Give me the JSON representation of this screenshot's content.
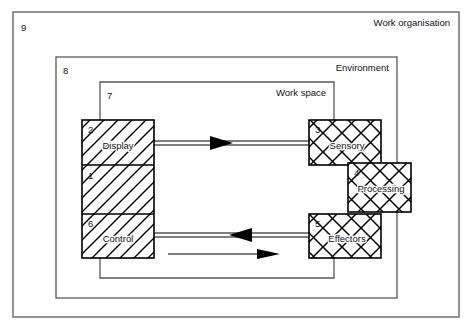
{
  "diagram": {
    "type": "block-diagram",
    "background_color": "#ffffff",
    "line_color": "#000000",
    "frame_color": "#555555",
    "frames": [
      {
        "id": "9",
        "number": "9",
        "label": "Work organisation",
        "label_align": "right",
        "x": 13,
        "y": 12,
        "width": 446,
        "height": 305
      },
      {
        "id": "8",
        "number": "8",
        "label": "Environment",
        "label_align": "right",
        "x": 56,
        "y": 57,
        "width": 341,
        "height": 241
      },
      {
        "id": "7",
        "number": "7",
        "label": "Work space",
        "label_align": "right",
        "x": 100,
        "y": 82,
        "width": 234,
        "height": 196
      }
    ],
    "machine_stack": {
      "name": "machine",
      "hatch": "diagonal",
      "x": 82,
      "y": 120,
      "width": 72,
      "height": 138,
      "sections": [
        {
          "number": "2",
          "label": "Display",
          "height": 45
        },
        {
          "number": "1",
          "label": "",
          "height": 49
        },
        {
          "number": "6",
          "label": "Control",
          "height": 44
        }
      ]
    },
    "human_blocks": [
      {
        "number": "3",
        "label": "Sensory",
        "hatch": "cross",
        "x": 309,
        "y": 120,
        "width": 72,
        "height": 45
      },
      {
        "number": "4",
        "label": "Processing",
        "hatch": "cross",
        "x": 348,
        "y": 163,
        "width": 63,
        "height": 49
      },
      {
        "number": "5",
        "label": "Effectors",
        "hatch": "cross",
        "x": 309,
        "y": 214,
        "width": 72,
        "height": 44
      }
    ],
    "connections": [
      {
        "name": "display-to-sensory",
        "style": "double-line",
        "direction": "right",
        "from": "Display",
        "to": "Sensory"
      },
      {
        "name": "effectors-to-control",
        "style": "double-line",
        "direction": "left",
        "from": "Effectors",
        "to": "Control"
      },
      {
        "name": "control-to-effectors-action",
        "style": "single-line",
        "direction": "right",
        "from": "Control",
        "to": "Effectors"
      }
    ]
  }
}
